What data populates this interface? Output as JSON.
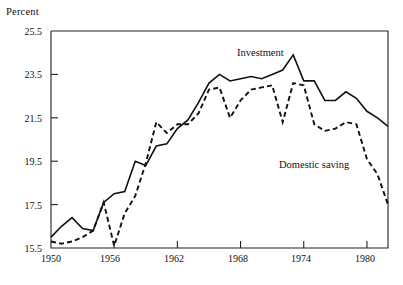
{
  "axes": {
    "y_axis_title": "Percent",
    "y_ticks": [
      "15.5",
      "17.5",
      "19.5",
      "21.5",
      "23.5",
      "25.5"
    ],
    "x_ticks": [
      "1950",
      "1956",
      "1962",
      "1968",
      "1974",
      "1980"
    ]
  },
  "labels": {
    "investment": "Investment",
    "domestic_saving": "Domestic saving"
  },
  "source_note": "",
  "colors": {
    "ink": "#111111",
    "frame": "#222222",
    "background": "#ffffff"
  },
  "chart_data": {
    "type": "line",
    "title": "",
    "subtitle": "",
    "xlabel": "",
    "ylabel": "Percent",
    "xlim": [
      1950,
      1982
    ],
    "ylim": [
      15.5,
      25.5
    ],
    "grid": false,
    "legend": "inline-annotations",
    "yticks": [
      15.5,
      17.5,
      19.5,
      21.5,
      23.5,
      25.5
    ],
    "xticks": [
      1950,
      1956,
      1962,
      1968,
      1974,
      1980
    ],
    "x": [
      1950,
      1951,
      1952,
      1953,
      1954,
      1955,
      1956,
      1957,
      1958,
      1959,
      1960,
      1961,
      1962,
      1963,
      1964,
      1965,
      1966,
      1967,
      1968,
      1969,
      1970,
      1971,
      1972,
      1973,
      1974,
      1975,
      1976,
      1977,
      1978,
      1979,
      1980,
      1981,
      1982
    ],
    "series": [
      {
        "name": "Investment",
        "style": "solid",
        "values": [
          16.0,
          16.5,
          16.9,
          16.4,
          16.3,
          17.6,
          18.0,
          18.1,
          19.5,
          19.3,
          20.2,
          20.3,
          21.0,
          21.4,
          22.2,
          23.1,
          23.5,
          23.2,
          23.3,
          23.4,
          23.3,
          23.5,
          23.7,
          24.4,
          23.2,
          23.2,
          22.3,
          22.3,
          22.7,
          22.4,
          21.8,
          21.5,
          21.1
        ]
      },
      {
        "name": "Domestic saving",
        "style": "dashed",
        "values": [
          15.8,
          15.7,
          15.8,
          16.0,
          16.3,
          17.6,
          15.6,
          17.1,
          17.9,
          19.4,
          21.3,
          20.8,
          21.2,
          21.2,
          21.7,
          22.8,
          22.9,
          21.5,
          22.3,
          22.8,
          22.9,
          23.0,
          21.3,
          23.1,
          23.0,
          21.2,
          20.9,
          21.0,
          21.3,
          21.2,
          19.6,
          18.9,
          17.5
        ]
      }
    ],
    "annotations": [
      {
        "text": "Investment",
        "x": 1967.5,
        "y": 24.3
      },
      {
        "text": "Domestic saving",
        "x": 1972.0,
        "y": 19.3
      }
    ]
  }
}
